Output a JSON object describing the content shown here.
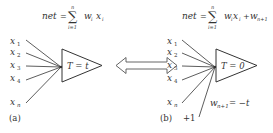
{
  "panel_a": {
    "formula": {
      "lhs": "net",
      "eq": "=",
      "sum": "∑",
      "sum_top": "n",
      "sum_bottom": "i=1",
      "term_w": "w",
      "term_w_sub": "i",
      "term_x": "x",
      "term_x_sub": "i"
    },
    "inputs": [
      {
        "base": "x",
        "sub": "1"
      },
      {
        "base": "x",
        "sub": "2"
      },
      {
        "base": "x",
        "sub": "3"
      },
      {
        "base": "x",
        "sub": "4"
      },
      {
        "base": "x",
        "sub": "n"
      }
    ],
    "threshold_label": "T = t",
    "caption": "(a)"
  },
  "arrow": {
    "type": "double-headed",
    "meaning": "equivalent"
  },
  "panel_b": {
    "formula": {
      "lhs": "net",
      "eq": "=",
      "sum": "∑",
      "sum_top": "n",
      "sum_bottom": "i=1",
      "term_w": "w",
      "term_w_sub": "i",
      "term_x": "x",
      "term_x_sub": "i",
      "plus": "+",
      "bias_w": "w",
      "bias_w_sub": "n+1"
    },
    "inputs": [
      {
        "base": "x",
        "sub": "1"
      },
      {
        "base": "x",
        "sub": "2"
      },
      {
        "base": "x",
        "sub": "3"
      },
      {
        "base": "x",
        "sub": "4"
      },
      {
        "base": "x",
        "sub": "n"
      }
    ],
    "threshold_label": "T = 0",
    "bias_input": "+1",
    "bias_weight": {
      "base": "w",
      "sub": "n+1",
      "rhs": "= −t"
    },
    "caption": "(b)"
  }
}
